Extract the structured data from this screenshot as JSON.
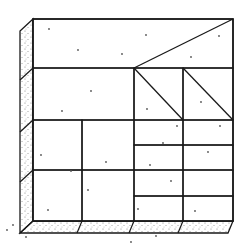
{
  "diagram": {
    "colors": {
      "line": "#1a1a1a",
      "background": "#ffffff",
      "stipple": "#555555"
    },
    "face": {
      "x1": 33,
      "y1": 19,
      "x2": 233,
      "y2": 221
    },
    "side": {
      "offset_x": -13,
      "offset_y": 12
    },
    "base": {
      "offset_x": -5,
      "offset_y": 12
    },
    "panels": [
      {
        "id": "top-band",
        "x": 33,
        "y": 19,
        "w": 200,
        "h": 49,
        "diagonal": [
          134,
          68,
          233,
          19
        ]
      },
      {
        "id": "middle-left",
        "x": 33,
        "y": 68,
        "w": 101,
        "h": 52
      },
      {
        "id": "triangle-square-1",
        "x": 134,
        "y": 68,
        "w": 49,
        "h": 52,
        "diagonal": [
          134,
          68,
          183,
          120
        ]
      },
      {
        "id": "triangle-square-2",
        "x": 183,
        "y": 68,
        "w": 50,
        "h": 52,
        "diagonal": [
          183,
          68,
          233,
          120
        ]
      },
      {
        "id": "lower-left-a",
        "x": 33,
        "y": 120,
        "w": 49,
        "h": 50
      },
      {
        "id": "lower-left-b",
        "x": 82,
        "y": 120,
        "w": 52,
        "h": 50
      },
      {
        "id": "lower-left-c",
        "x": 33,
        "y": 170,
        "w": 49,
        "h": 51
      },
      {
        "id": "lower-left-d",
        "x": 82,
        "y": 170,
        "w": 52,
        "h": 51
      },
      {
        "id": "strip-1a",
        "x": 134,
        "y": 120,
        "w": 49,
        "h": 25
      },
      {
        "id": "strip-1b",
        "x": 183,
        "y": 120,
        "w": 50,
        "h": 25
      },
      {
        "id": "strip-2a",
        "x": 134,
        "y": 145,
        "w": 49,
        "h": 25
      },
      {
        "id": "strip-2b",
        "x": 183,
        "y": 145,
        "w": 50,
        "h": 25
      },
      {
        "id": "strip-3a",
        "x": 134,
        "y": 170,
        "w": 49,
        "h": 26
      },
      {
        "id": "strip-3b",
        "x": 183,
        "y": 170,
        "w": 50,
        "h": 26
      },
      {
        "id": "strip-4a",
        "x": 134,
        "y": 196,
        "w": 49,
        "h": 25
      },
      {
        "id": "strip-4b",
        "x": 183,
        "y": 196,
        "w": 50,
        "h": 25
      }
    ],
    "dots": [
      [
        49,
        29
      ],
      [
        78,
        50
      ],
      [
        122,
        54
      ],
      [
        91,
        91
      ],
      [
        62,
        111
      ],
      [
        146,
        35
      ],
      [
        219,
        36
      ],
      [
        191,
        57
      ],
      [
        147,
        109
      ],
      [
        201,
        102
      ],
      [
        177,
        126
      ],
      [
        163,
        143
      ],
      [
        208,
        152
      ],
      [
        150,
        165
      ],
      [
        106,
        162
      ],
      [
        41,
        155
      ],
      [
        71,
        171
      ],
      [
        220,
        126
      ],
      [
        88,
        190
      ],
      [
        171,
        181
      ],
      [
        48,
        210
      ],
      [
        138,
        209
      ],
      [
        195,
        211
      ],
      [
        13,
        225
      ],
      [
        7,
        230
      ],
      [
        26,
        237
      ],
      [
        156,
        236
      ],
      [
        131,
        242
      ]
    ]
  }
}
